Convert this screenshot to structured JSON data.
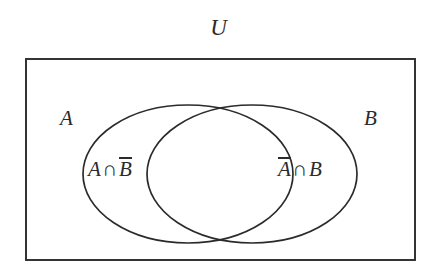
{
  "figure": {
    "kind": "venn-diagram",
    "background_color": "#ffffff",
    "stroke_color": "#2b2b2b",
    "universe_label": "U",
    "set_a_label": "A",
    "set_b_label": "B"
  },
  "regions": {
    "a_only": {
      "name": "A intersect B complement",
      "left_term": "A",
      "operator": "∩",
      "right_term": "B",
      "right_term_negated": true,
      "plain_text": "A ∩ B̄"
    },
    "b_only": {
      "name": "A complement intersect B",
      "left_term": "A",
      "left_term_negated": true,
      "operator": "∩",
      "right_term": "B",
      "plain_text": "Ā ∩ B"
    }
  },
  "geometry": {
    "universe_rect": {
      "x": 26,
      "y": 59,
      "width": 389,
      "height": 201
    },
    "ellipse_a": {
      "cx": 188,
      "cy": 174,
      "rx": 105,
      "ry": 69
    },
    "ellipse_b": {
      "cx": 252,
      "cy": 174,
      "rx": 105,
      "ry": 69
    },
    "stroke_width": 1.7
  }
}
